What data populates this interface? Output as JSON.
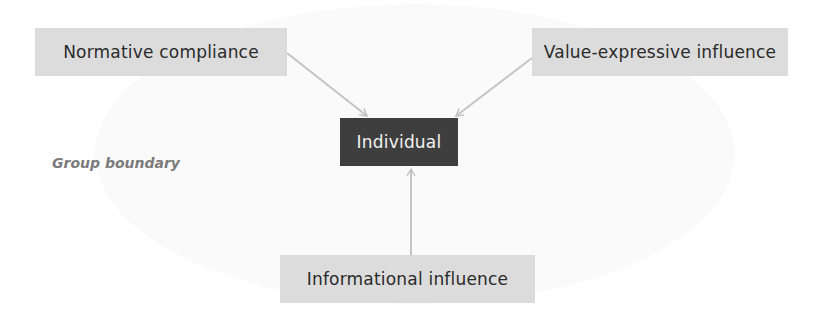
{
  "diagram": {
    "boundary_label": "Group boundary",
    "center_node": {
      "label": "Individual"
    },
    "influence_nodes": [
      {
        "id": "normative",
        "label": "Normative compliance"
      },
      {
        "id": "value_expressive",
        "label": "Value-expressive influence"
      },
      {
        "id": "informational",
        "label": "Informational influence"
      }
    ],
    "edges": [
      {
        "from": "Normative compliance",
        "to": "Individual"
      },
      {
        "from": "Value-expressive influence",
        "to": "Individual"
      },
      {
        "from": "Informational influence",
        "to": "Individual"
      }
    ],
    "colors": {
      "influence_box": "#dcdcdc",
      "center_box": "#3e3e3e",
      "arrow": "#c4c4c4",
      "boundary_label": "#7a7a7a"
    }
  }
}
